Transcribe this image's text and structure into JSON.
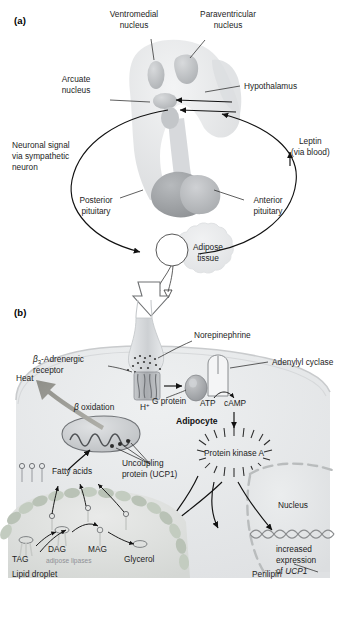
{
  "figure": {
    "panels": [
      {
        "id": "a",
        "letter": "(a)",
        "labels": {
          "ventromedial_nucleus": "Ventromedial\nnucleus",
          "ventromedial_nucleus_l1": "Ventromedial",
          "ventromedial_nucleus_l2": "nucleus",
          "paraventricular_nucleus_l1": "Paraventricular",
          "paraventricular_nucleus_l2": "nucleus",
          "arcuate_nucleus_l1": "Arcuate",
          "arcuate_nucleus_l2": "nucleus",
          "hypothalamus": "Hypothalamus",
          "neuronal_signal_l1": "Neuronal signal",
          "neuronal_signal_l2": "via sympathetic",
          "neuronal_signal_l3": "neuron",
          "leptin_l1": "Leptin",
          "leptin_l2": "(via blood)",
          "posterior_pituitary_l1": "Posterior",
          "posterior_pituitary_l2": "pituitary",
          "anterior_pituitary_l1": "Anterior",
          "anterior_pituitary_l2": "pituitary",
          "adipose_tissue_l1": "Adipose",
          "adipose_tissue_l2": "tissue"
        }
      },
      {
        "id": "b",
        "letter": "(b)",
        "labels": {
          "norepinephrine": "Norepinephrine",
          "adrenergic_receptor_beta": "β",
          "adrenergic_receptor_sub": "3",
          "adrenergic_receptor_l1": "-Adrenergic",
          "adrenergic_receptor_l2": "receptor",
          "adenylyl_cyclase": "Adenylyl cyclase",
          "heat": "Heat",
          "g_protein": "G protein",
          "atp": "ATP",
          "camp": "cAMP",
          "beta_oxidation_symbol": "β",
          "beta_oxidation_word": "oxidation",
          "proton": "H",
          "proton_sup": "+",
          "adipocyte": "Adipocyte",
          "protein_kinase_a": "Protein kinase A",
          "uncoupling_protein_l1": "Uncoupling",
          "uncoupling_protein_l2": "protein (UCP1)",
          "fatty_acids": "Fatty acids",
          "nucleus": "Nucleus",
          "increased_expression_l1": "increased",
          "increased_expression_l2": "expression",
          "increased_expression_l3_pre": "of ",
          "increased_expression_l3_gene": "UCP1",
          "tag": "TAG",
          "dag": "DAG",
          "mag": "MAG",
          "glycerol": "Glycerol",
          "adipose_lipases": "adipose lipases",
          "lipid_droplet": "Lipid droplet",
          "perilipin": "Perilipin"
        }
      }
    ]
  },
  "colors": {
    "ink": "#1d1d1d",
    "arrow": "#111111",
    "brain_light": "#e3e4e6",
    "brain_mid": "#c9cbcd",
    "brain_dark": "#a9abad",
    "pituitary_dark": "#9b9da0",
    "adipose_fill": "#e9eaec",
    "cell_fill": "#e6e8ea",
    "heat_arrow": "#9a9a94",
    "membrane_green": "#b9c2b6",
    "droplet_fill": "#dfe1df",
    "nucleus_dash": "#b9bcbd",
    "gray_text": "#8e9096",
    "receptor_fill": "#b9bcbf",
    "gprotein_fill": "#a7aaad",
    "dna_color": "#8b8d8f"
  }
}
